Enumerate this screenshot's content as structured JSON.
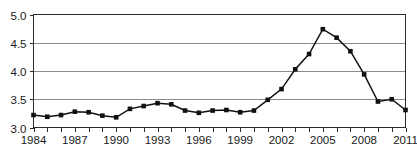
{
  "chart_data": {
    "type": "line",
    "title": "",
    "subtitle": "",
    "xlabel": "",
    "ylabel": "",
    "xlim": [
      1984,
      2011
    ],
    "ylim": [
      3.0,
      5.0
    ],
    "grid": "horizontal",
    "legend": "none",
    "marker": "filled-square",
    "line_color": "#111111",
    "grid_color": "#8a8a8a",
    "frame_color": "#2b2b2b",
    "background_color": "#ffffff",
    "y_ticks": [
      3.0,
      3.5,
      4.0,
      4.5,
      5.0
    ],
    "y_tick_labels": [
      "3.0",
      "3.5",
      "4.0",
      "4.5",
      "5.0"
    ],
    "x_tick_values": [
      1984,
      1985,
      1986,
      1987,
      1988,
      1989,
      1990,
      1991,
      1992,
      1993,
      1994,
      1995,
      1996,
      1997,
      1998,
      1999,
      2000,
      2001,
      2002,
      2003,
      2004,
      2005,
      2006,
      2007,
      2008,
      2009,
      2010,
      2011
    ],
    "x_tick_labels": [
      "1984",
      "",
      "",
      "1987",
      "",
      "",
      "1990",
      "",
      "",
      "1993",
      "",
      "",
      "1996",
      "",
      "",
      "1999",
      "",
      "",
      "2002",
      "",
      "",
      "2005",
      "",
      "",
      "2008",
      "",
      "",
      "2011"
    ],
    "x_labeled_values": [
      1984,
      1987,
      1990,
      1993,
      1996,
      1999,
      2002,
      2005,
      2008,
      2011
    ],
    "x": [
      1984,
      1985,
      1986,
      1987,
      1988,
      1989,
      1990,
      1991,
      1992,
      1993,
      1994,
      1995,
      1996,
      1997,
      1998,
      1999,
      2000,
      2001,
      2002,
      2003,
      2004,
      2005,
      2006,
      2007,
      2008,
      2009,
      2010,
      2011
    ],
    "values": [
      3.22,
      3.19,
      3.22,
      3.28,
      3.27,
      3.21,
      3.18,
      3.33,
      3.38,
      3.43,
      3.41,
      3.3,
      3.26,
      3.3,
      3.31,
      3.27,
      3.3,
      3.49,
      3.68,
      4.03,
      4.3,
      4.74,
      4.59,
      4.35,
      3.94,
      3.46,
      3.5,
      3.31
    ],
    "series": [
      {
        "name": "series-1",
        "values": [
          3.22,
          3.19,
          3.22,
          3.28,
          3.27,
          3.21,
          3.18,
          3.33,
          3.38,
          3.43,
          3.41,
          3.3,
          3.26,
          3.3,
          3.31,
          3.27,
          3.3,
          3.49,
          3.68,
          4.03,
          4.3,
          4.74,
          4.59,
          4.35,
          3.94,
          3.46,
          3.5,
          3.31
        ]
      }
    ],
    "annotations": []
  }
}
